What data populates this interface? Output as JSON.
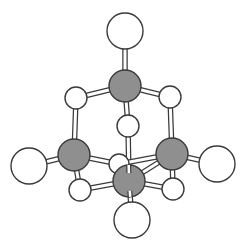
{
  "diagram": {
    "title": "",
    "type": "ball-and-stick molecular model",
    "colors": {
      "background": "#ffffff",
      "carbon_fill": "#8f8f8f",
      "hydrogen_fill": "#ffffff",
      "outline": "#3a3a3a",
      "bond_fill": "#ffffff"
    },
    "atoms": [
      {
        "id": "A1",
        "kind": "large-white",
        "x": 125,
        "y": 31,
        "r": 18
      },
      {
        "id": "C1",
        "kind": "gray",
        "x": 125,
        "y": 86,
        "r": 16
      },
      {
        "id": "S1",
        "kind": "small-white",
        "x": 76,
        "y": 98,
        "r": 11
      },
      {
        "id": "S2",
        "kind": "small-white",
        "x": 170,
        "y": 97,
        "r": 11
      },
      {
        "id": "S3",
        "kind": "small-white",
        "x": 128,
        "y": 126,
        "r": 11
      },
      {
        "id": "S4",
        "kind": "small-white",
        "x": 119,
        "y": 164,
        "r": 10
      },
      {
        "id": "C2",
        "kind": "gray",
        "x": 74,
        "y": 155,
        "r": 16
      },
      {
        "id": "C3",
        "kind": "gray",
        "x": 172,
        "y": 154,
        "r": 16
      },
      {
        "id": "A2",
        "kind": "large-white",
        "x": 29,
        "y": 166,
        "r": 18
      },
      {
        "id": "A3",
        "kind": "large-white",
        "x": 217,
        "y": 164,
        "r": 18
      },
      {
        "id": "S5",
        "kind": "small-white",
        "x": 80,
        "y": 190,
        "r": 11
      },
      {
        "id": "S6",
        "kind": "small-white",
        "x": 173,
        "y": 189,
        "r": 11
      },
      {
        "id": "C4",
        "kind": "gray",
        "x": 129,
        "y": 181,
        "r": 16
      },
      {
        "id": "A4",
        "kind": "large-white",
        "x": 132,
        "y": 220,
        "r": 18
      }
    ],
    "bonds": [
      [
        "A1",
        "C1"
      ],
      [
        "C1",
        "S1"
      ],
      [
        "C1",
        "S2"
      ],
      [
        "C1",
        "S3"
      ],
      [
        "S1",
        "C2"
      ],
      [
        "S2",
        "C3"
      ],
      [
        "S3",
        "C4"
      ],
      [
        "C2",
        "A2"
      ],
      [
        "C3",
        "A3"
      ],
      [
        "C2",
        "S4"
      ],
      [
        "C3",
        "S4"
      ],
      [
        "C2",
        "S5"
      ],
      [
        "C3",
        "S6"
      ],
      [
        "S5",
        "C4"
      ],
      [
        "S6",
        "C4"
      ],
      [
        "C4",
        "A4"
      ],
      [
        "C4",
        "C3"
      ]
    ]
  }
}
